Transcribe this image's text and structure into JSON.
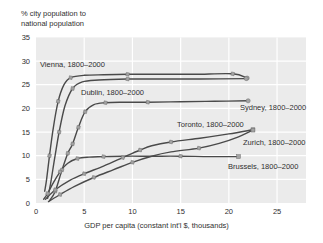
{
  "figure": {
    "title_line1": "% city population to",
    "title_line2": "national population",
    "x_axis_label": "GDP per capita (constant int'l $, thousands)"
  },
  "style": {
    "plot_bg": "#ebebeb",
    "grid_color": "#ffffff",
    "line_color": "#4a4a4a",
    "marker_fill": "#a3a3a3",
    "marker_stroke": "#6e6e6e",
    "text_color": "#2f2f2f"
  },
  "chart_data": {
    "type": "line",
    "xlabel": "GDP per capita (constant int'l $, thousands)",
    "ylabel": "% city population to national population",
    "xlim": [
      0,
      28
    ],
    "ylim": [
      0,
      35
    ],
    "x_ticks": [
      0,
      5,
      10,
      15,
      20,
      25
    ],
    "y_ticks": [
      0,
      5,
      10,
      15,
      20,
      25,
      30,
      35
    ],
    "grid": true,
    "legend_position": "inline-labels",
    "series": [
      {
        "name": "vienna",
        "label": "Vienna, 1800–2000",
        "points": [
          [
            0.9,
            2.5
          ],
          [
            1.1,
            5
          ],
          [
            1.4,
            10
          ],
          [
            1.8,
            16
          ],
          [
            2.3,
            21.5
          ],
          [
            2.9,
            25
          ],
          [
            3.6,
            26.5
          ],
          [
            5,
            27
          ],
          [
            7,
            27.1
          ],
          [
            9.5,
            27.2
          ],
          [
            13,
            27.2
          ],
          [
            16.5,
            27.2
          ],
          [
            20.4,
            27.3
          ],
          [
            21.9,
            26.4
          ]
        ],
        "marker_idx": [
          2,
          4,
          6,
          9,
          12
        ],
        "end_marker": "dot",
        "label_px": {
          "x": 40,
          "y": 67
        }
      },
      {
        "name": "dublin",
        "label": "Dublin, 1800–2000",
        "points": [
          [
            1.2,
            1
          ],
          [
            1.5,
            4
          ],
          [
            1.9,
            9
          ],
          [
            2.4,
            15
          ],
          [
            3.0,
            20.5
          ],
          [
            3.8,
            24.2
          ],
          [
            4.8,
            25.6
          ],
          [
            6.5,
            26.0
          ],
          [
            9.5,
            26.2
          ],
          [
            13,
            26.2
          ],
          [
            17,
            26.2
          ],
          [
            21.8,
            26.3
          ]
        ],
        "marker_idx": [
          3,
          5,
          8
        ],
        "end_marker": "dot",
        "label_px": {
          "x": 81,
          "y": 95
        }
      },
      {
        "name": "sydney",
        "label": "Sydney, 1800–2000",
        "points": [
          [
            1.4,
            0.5
          ],
          [
            2.0,
            2.5
          ],
          [
            2.7,
            7
          ],
          [
            3.3,
            10.5
          ],
          [
            3.8,
            12.5
          ],
          [
            4.4,
            16
          ],
          [
            5.1,
            19.3
          ],
          [
            6.0,
            20.8
          ],
          [
            7.2,
            21.2
          ],
          [
            9,
            21.3
          ],
          [
            11.6,
            21.3
          ],
          [
            15,
            21.4
          ],
          [
            18.5,
            21.5
          ],
          [
            22,
            21.6
          ]
        ],
        "marker_idx": [
          1,
          2,
          3,
          4,
          5,
          6,
          8,
          10
        ],
        "end_marker": "dot",
        "label_px": {
          "x": 240,
          "y": 110
        }
      },
      {
        "name": "toronto",
        "label": "Toronto, 1800–2000",
        "points": [
          [
            1.0,
            0.8
          ],
          [
            2.0,
            2.8
          ],
          [
            3.5,
            4.8
          ],
          [
            5.0,
            6.2
          ],
          [
            7.0,
            7.8
          ],
          [
            9.0,
            9.6
          ],
          [
            10.8,
            11.2
          ],
          [
            12,
            12.1
          ],
          [
            14,
            12.9
          ],
          [
            17,
            13.7
          ],
          [
            20,
            14.6
          ],
          [
            22.5,
            15.5
          ]
        ],
        "marker_idx": [
          1,
          3,
          5,
          6,
          8
        ],
        "end_marker": "square",
        "label_px": {
          "x": 177,
          "y": 127
        }
      },
      {
        "name": "zurich",
        "label": "Zurich, 1800–2000",
        "points": [
          [
            1.3,
            0.3
          ],
          [
            2.5,
            1.8
          ],
          [
            4.0,
            3.5
          ],
          [
            6.0,
            5.4
          ],
          [
            8.0,
            7.0
          ],
          [
            10.0,
            8.6
          ],
          [
            12.0,
            9.9
          ],
          [
            14.0,
            10.8
          ],
          [
            16.9,
            11.6
          ],
          [
            19,
            12.6
          ],
          [
            21,
            14.0
          ],
          [
            22.5,
            15.4
          ]
        ],
        "marker_idx": [
          1,
          3,
          5,
          8
        ],
        "end_marker": "square",
        "label_px": {
          "x": 243,
          "y": 145
        }
      },
      {
        "name": "brussels",
        "label": "Brussels, 1800–2000",
        "points": [
          [
            0.8,
            0.8
          ],
          [
            1.2,
            2.0
          ],
          [
            1.8,
            4.3
          ],
          [
            2.5,
            6.6
          ],
          [
            3.3,
            8.4
          ],
          [
            4.3,
            9.4
          ],
          [
            5.5,
            9.7
          ],
          [
            7,
            9.8
          ],
          [
            9,
            9.9
          ],
          [
            12,
            9.9
          ],
          [
            15,
            9.9
          ],
          [
            18,
            9.8
          ],
          [
            21,
            9.8
          ]
        ],
        "marker_idx": [
          1,
          3,
          5,
          7,
          10
        ],
        "end_marker": "square",
        "label_px": {
          "x": 228,
          "y": 169
        }
      }
    ]
  }
}
